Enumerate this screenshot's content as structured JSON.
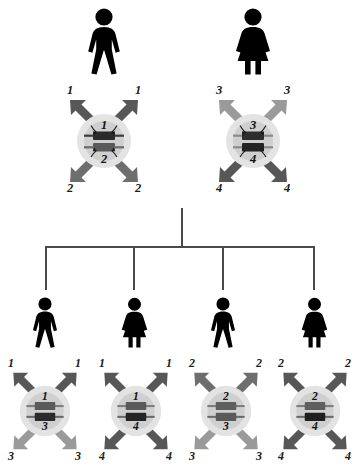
{
  "diagram": {
    "type": "genetics-inheritance-diagram",
    "colors": {
      "arrow_dark": "#575757",
      "arrow_medium": "#6e6e6e",
      "arrow_light": "#9a9a9a",
      "chromosome_dark": "#2b2b2b",
      "chromosome_medium": "#5a5a5a",
      "chromosome_light": "#8a8a8a",
      "cell_outer": "#e3e3e3",
      "cell_inner": "#cfcfcf",
      "line": "#4a4a4a",
      "figure": "#000000",
      "label": "#1a1a1a"
    }
  },
  "parents": [
    {
      "id": "father",
      "sex": "male",
      "figure_icon": "male-figure-icon",
      "cell": {
        "name": "father-cell",
        "chromosomes": [
          {
            "label": "1",
            "shade": "dark"
          },
          {
            "label": "2",
            "shade": "medium"
          }
        ],
        "inner_top_label": "1",
        "inner_bottom_label": "2",
        "corner_labels": {
          "top_left": "1",
          "top_right": "1",
          "bottom_left": "2",
          "bottom_right": "2"
        },
        "arrow_shades": {
          "top": "dark",
          "bottom": "medium"
        }
      }
    },
    {
      "id": "mother",
      "sex": "female",
      "figure_icon": "female-figure-icon",
      "cell": {
        "name": "mother-cell",
        "chromosomes": [
          {
            "label": "3",
            "shade": "light"
          },
          {
            "label": "4",
            "shade": "dark"
          }
        ],
        "inner_top_label": "3",
        "inner_bottom_label": "4",
        "corner_labels": {
          "top_left": "3",
          "top_right": "3",
          "bottom_left": "4",
          "bottom_right": "4"
        },
        "arrow_shades": {
          "top": "light",
          "bottom": "dark"
        }
      }
    }
  ],
  "offspring": [
    {
      "id": "child-1",
      "sex": "male",
      "figure_icon": "male-figure-icon",
      "cell": {
        "name": "child-1-cell",
        "chromosomes": [
          {
            "label": "1",
            "shade": "medium"
          },
          {
            "label": "3",
            "shade": "dark"
          }
        ],
        "inner_top_label": "1",
        "inner_bottom_label": "3",
        "corner_labels": {
          "top_left": "1",
          "top_right": "1",
          "bottom_left": "3",
          "bottom_right": "3"
        },
        "arrow_shades": {
          "top": "dark",
          "bottom": "light"
        }
      }
    },
    {
      "id": "child-2",
      "sex": "female",
      "figure_icon": "female-figure-icon",
      "cell": {
        "name": "child-2-cell",
        "chromosomes": [
          {
            "label": "1",
            "shade": "medium"
          },
          {
            "label": "4",
            "shade": "dark"
          }
        ],
        "inner_top_label": "1",
        "inner_bottom_label": "4",
        "corner_labels": {
          "top_left": "1",
          "top_right": "1",
          "bottom_left": "4",
          "bottom_right": "4"
        },
        "arrow_shades": {
          "top": "dark",
          "bottom": "dark"
        }
      }
    },
    {
      "id": "child-3",
      "sex": "male",
      "figure_icon": "male-figure-icon",
      "cell": {
        "name": "child-3-cell",
        "chromosomes": [
          {
            "label": "2",
            "shade": "medium"
          },
          {
            "label": "3",
            "shade": "medium"
          }
        ],
        "inner_top_label": "2",
        "inner_bottom_label": "3",
        "corner_labels": {
          "top_left": "2",
          "top_right": "2",
          "bottom_left": "3",
          "bottom_right": "3"
        },
        "arrow_shades": {
          "top": "medium",
          "bottom": "light"
        }
      }
    },
    {
      "id": "child-4",
      "sex": "female",
      "figure_icon": "female-figure-icon",
      "cell": {
        "name": "child-4-cell",
        "chromosomes": [
          {
            "label": "2",
            "shade": "medium"
          },
          {
            "label": "4",
            "shade": "dark"
          }
        ],
        "inner_top_label": "2",
        "inner_bottom_label": "4",
        "corner_labels": {
          "top_left": "2",
          "top_right": "2",
          "bottom_left": "4",
          "bottom_right": "4"
        },
        "arrow_shades": {
          "top": "dark",
          "bottom": "dark"
        }
      }
    }
  ]
}
